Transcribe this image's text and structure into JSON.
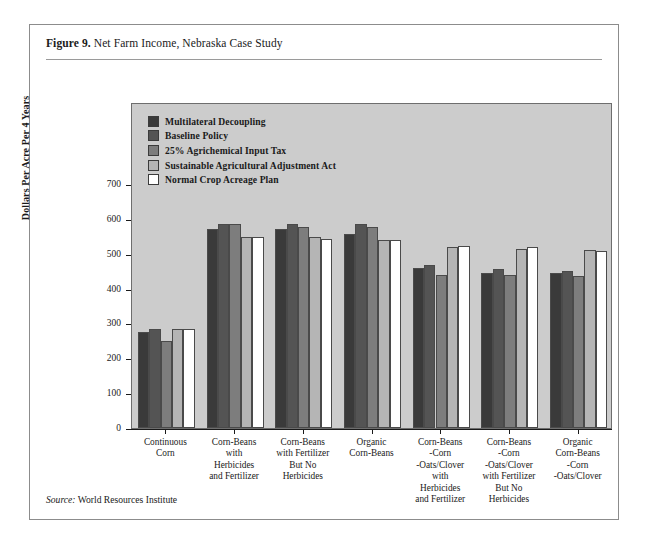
{
  "figure": {
    "label": "Figure 9.",
    "title": "Net Farm Income, Nebraska Case Study",
    "source_label": "Source:",
    "source_text": "World Resources Institute"
  },
  "chart_data": {
    "type": "bar",
    "title": "Net Farm Income, Nebraska Case Study",
    "xlabel": "",
    "ylabel": "Dollars Per Acre Per 4 Years",
    "ylim": [
      0,
      700
    ],
    "yticks": [
      0,
      100,
      200,
      300,
      400,
      500,
      600,
      700
    ],
    "ytick_labels": [
      "0",
      "100",
      "200",
      "300",
      "400",
      "500",
      "600",
      "700"
    ],
    "grid": false,
    "legend_position": "upper-left-inside",
    "plot_background": "#cccccc",
    "categories": [
      "Continuous\nCorn",
      "Corn-Beans\nwith\nHerbicides\nand Fertilizer",
      "Corn-Beans\nwith Fertilizer\nBut No\nHerbicides",
      "Organic\nCorn-Beans",
      "Corn-Beans\n-Corn\n-Oats/Clover\nwith\nHerbicides\nand Fertilizer",
      "Corn-Beans\n-Corn\n-Oats/Clover\nwith Fertilizer\nBut No\nHerbicides",
      "Organic\nCorn-Beans\n-Corn\n-Oats/Clover"
    ],
    "series": [
      {
        "name": "Multilateral Decoupling",
        "color": "#3a3a3a",
        "values": [
          275,
          570,
          570,
          558,
          460,
          445,
          445
        ]
      },
      {
        "name": "Baseline Policy",
        "color": "#545454",
        "values": [
          285,
          585,
          585,
          585,
          468,
          455,
          450
        ]
      },
      {
        "name": "25%  Agrichemical Input Tax",
        "color": "#7d7d7d",
        "values": [
          250,
          585,
          578,
          578,
          440,
          438,
          437
        ]
      },
      {
        "name": "Sustainable Agricultural Adjustment Act",
        "color": "#b5b5b5",
        "values": [
          285,
          548,
          548,
          538,
          518,
          515,
          512
        ]
      },
      {
        "name": "Normal Crop Acreage Plan",
        "color": "#ffffff",
        "values": [
          285,
          548,
          543,
          538,
          523,
          518,
          508
        ]
      }
    ]
  }
}
